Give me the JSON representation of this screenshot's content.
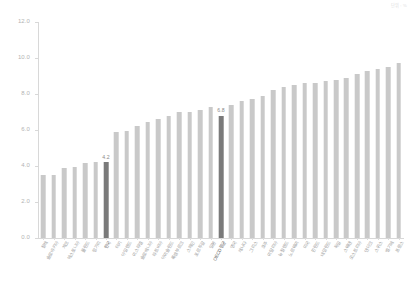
{
  "corner_note": "단위 : %",
  "chart_data": {
    "type": "bar",
    "title": "",
    "subtitle": "",
    "xlabel": "",
    "ylabel": "",
    "ylim": [
      0.0,
      12.0
    ],
    "ytick_labels": [
      "0.0",
      "2.0",
      "4.0",
      "6.0",
      "8.0",
      "10.0",
      "12.0"
    ],
    "ytick_values": [
      0.0,
      2.0,
      4.0,
      6.0,
      8.0,
      10.0,
      12.0
    ],
    "grid": false,
    "legend": "none",
    "bar_color": "#c9c9c9",
    "highlight_color": "#7a7a7a",
    "categories": [
      "칠레",
      "슬로바키아",
      "체코",
      "에스토니아",
      "폴란드",
      "헝가리",
      "한국",
      "터키",
      "아일랜드",
      "이스라엘",
      "슬로베니아",
      "라트비아",
      "아이슬란드",
      "룩셈부르크",
      "스페인",
      "포르투갈",
      "일본",
      "OECD평균",
      "영국",
      "캐나다",
      "그리스",
      "호주",
      "이탈리아",
      "뉴질랜드",
      "노르웨이",
      "미국",
      "핀란드",
      "네덜란드",
      "독일",
      "스웨덴",
      "오스트리아",
      "덴마크",
      "스위스",
      "벨기에",
      "프랑스"
    ],
    "values": [
      3.5,
      3.5,
      3.9,
      3.95,
      4.15,
      4.2,
      4.2,
      5.9,
      5.95,
      6.2,
      6.45,
      6.6,
      6.8,
      7.0,
      7.0,
      7.1,
      7.3,
      6.8,
      7.4,
      7.6,
      7.7,
      7.9,
      8.2,
      8.4,
      8.5,
      8.6,
      8.6,
      8.7,
      8.8,
      8.9,
      9.1,
      9.3,
      9.4,
      9.5,
      9.7
    ],
    "highlighted_indices": [
      6,
      17
    ],
    "value_labels": [
      {
        "index": 6,
        "text": "4.2"
      },
      {
        "index": 17,
        "text": "6.8"
      }
    ]
  }
}
